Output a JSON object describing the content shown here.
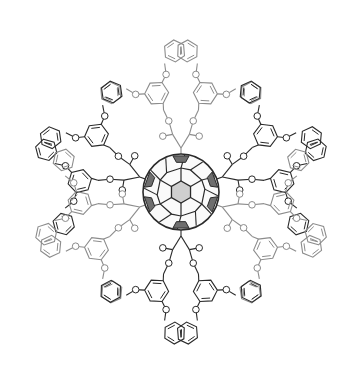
{
  "figure": {
    "atom_label": "O",
    "colors": {
      "dark": "#2a2a2a",
      "light": "#8c8c8c",
      "shade_dark": "#6e6e6e",
      "shade_light": "#cfcfcf",
      "background": "#ffffff"
    },
    "fullerene": {
      "cx": 181,
      "cy": 192,
      "r": 38
    },
    "adducts": [
      {
        "name": "top",
        "angle": -90,
        "tone": "light"
      },
      {
        "name": "upper-left",
        "angle": -160,
        "tone": "dark"
      },
      {
        "name": "upper-right",
        "angle": -20,
        "tone": "dark"
      },
      {
        "name": "lower-left",
        "angle": 160,
        "tone": "light"
      },
      {
        "name": "lower-right",
        "angle": 20,
        "tone": "light"
      },
      {
        "name": "bottom",
        "angle": 90,
        "tone": "dark"
      }
    ]
  }
}
